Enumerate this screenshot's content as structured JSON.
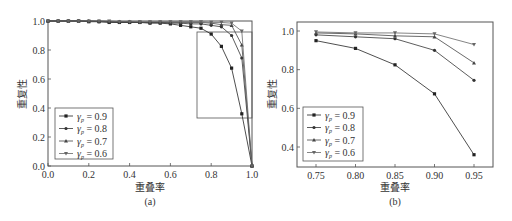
{
  "chart_data": [
    {
      "panel": "(a)",
      "type": "line",
      "xlabel": "重叠率",
      "ylabel": "重复性",
      "xlim": [
        0.0,
        1.0
      ],
      "ylim": [
        0.0,
        1.0
      ],
      "xticks": [
        "0.0",
        "0.2",
        "0.4",
        "0.6",
        "0.8",
        "1.0"
      ],
      "yticks": [
        "0.0",
        "0.2",
        "0.4",
        "0.6",
        "0.8",
        "1.0"
      ],
      "legend_position": "lower left",
      "x": [
        0.0,
        0.05,
        0.1,
        0.15,
        0.2,
        0.25,
        0.3,
        0.35,
        0.4,
        0.45,
        0.5,
        0.55,
        0.6,
        0.65,
        0.7,
        0.75,
        0.8,
        0.85,
        0.9,
        0.95,
        1.0
      ],
      "series": [
        {
          "name": "γp = 0.9",
          "values": [
            1.0,
            1.0,
            1.0,
            1.0,
            0.995,
            0.995,
            0.99,
            0.99,
            0.99,
            0.99,
            0.985,
            0.985,
            0.98,
            0.97,
            0.96,
            0.95,
            0.91,
            0.825,
            0.675,
            0.36,
            0.0
          ]
        },
        {
          "name": "γp = 0.8",
          "values": [
            1.0,
            1.0,
            1.0,
            1.0,
            1.0,
            0.995,
            0.995,
            0.99,
            0.99,
            0.99,
            0.99,
            0.99,
            0.985,
            0.985,
            0.98,
            0.98,
            0.97,
            0.96,
            0.9,
            0.745,
            0.0
          ]
        },
        {
          "name": "γp = 0.7",
          "values": [
            1.0,
            1.0,
            1.0,
            1.0,
            1.0,
            1.0,
            0.995,
            0.995,
            0.995,
            0.99,
            0.99,
            0.99,
            0.99,
            0.99,
            0.99,
            0.99,
            0.985,
            0.975,
            0.97,
            0.835,
            0.0
          ]
        },
        {
          "name": "γp = 0.6",
          "values": [
            1.0,
            1.0,
            1.0,
            1.0,
            1.0,
            1.0,
            1.0,
            0.995,
            0.995,
            0.995,
            0.995,
            0.995,
            0.995,
            0.995,
            0.995,
            0.995,
            0.99,
            0.99,
            0.985,
            0.93,
            0.0
          ]
        }
      ],
      "annotation": "zoom box x∈[0.73,1.0], y∈[0.33,1.0]",
      "caption": "(a)"
    },
    {
      "panel": "(b)",
      "type": "line",
      "xlabel": "重叠率",
      "ylabel": "重复性",
      "xlim": [
        0.72,
        0.98
      ],
      "ylim": [
        0.31,
        1.05
      ],
      "xticks": [
        "0.75",
        "0.80",
        "0.85",
        "0.90",
        "0.95"
      ],
      "yticks": [
        "0.4",
        "0.6",
        "0.8",
        "1.0"
      ],
      "legend_position": "lower left",
      "x": [
        0.75,
        0.8,
        0.85,
        0.9,
        0.95
      ],
      "series": [
        {
          "name": "γp = 0.9",
          "values": [
            0.95,
            0.91,
            0.825,
            0.675,
            0.36
          ]
        },
        {
          "name": "γp = 0.8",
          "values": [
            0.98,
            0.97,
            0.96,
            0.9,
            0.745
          ]
        },
        {
          "name": "γp = 0.7",
          "values": [
            0.99,
            0.985,
            0.975,
            0.97,
            0.835
          ]
        },
        {
          "name": "γp = 0.6",
          "values": [
            0.995,
            0.99,
            0.99,
            0.985,
            0.93
          ]
        }
      ],
      "caption": "(b)"
    }
  ],
  "labels": {
    "a": {
      "xlabel": "重叠率",
      "ylabel": "重复性",
      "caption": "(a)"
    },
    "b": {
      "xlabel": "重叠率",
      "ylabel": "重复性",
      "caption": "(b)"
    }
  },
  "legend": [
    {
      "label": "= 0.9",
      "color": "#222222",
      "marker": "square"
    },
    {
      "label": "= 0.8",
      "color": "#333333",
      "marker": "circle"
    },
    {
      "label": "= 0.7",
      "color": "#444444",
      "marker": "triangle"
    },
    {
      "label": "= 0.6",
      "color": "#666666",
      "marker": "down-triangle"
    }
  ]
}
